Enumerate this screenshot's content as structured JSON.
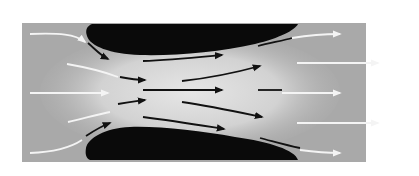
{
  "diagram": {
    "type": "venturi-flow",
    "colors": {
      "background": "#ffffff",
      "panel": "#a9a9a9",
      "throat": "#dcdcdc",
      "obstacle": "#0a0a0a",
      "inflow_arrow": "#f4f4f4",
      "throat_arrow": "#111111",
      "outflow_arrow": "#f4f4f4"
    },
    "panel": {
      "x": 22,
      "y": 23,
      "width": 344,
      "height": 139
    },
    "obstacles": [
      {
        "name": "upper-wing"
      },
      {
        "name": "lower-wing"
      }
    ],
    "flow_lines": {
      "inflow_count": 5,
      "throat_count": 10,
      "outflow_count": 5
    }
  }
}
